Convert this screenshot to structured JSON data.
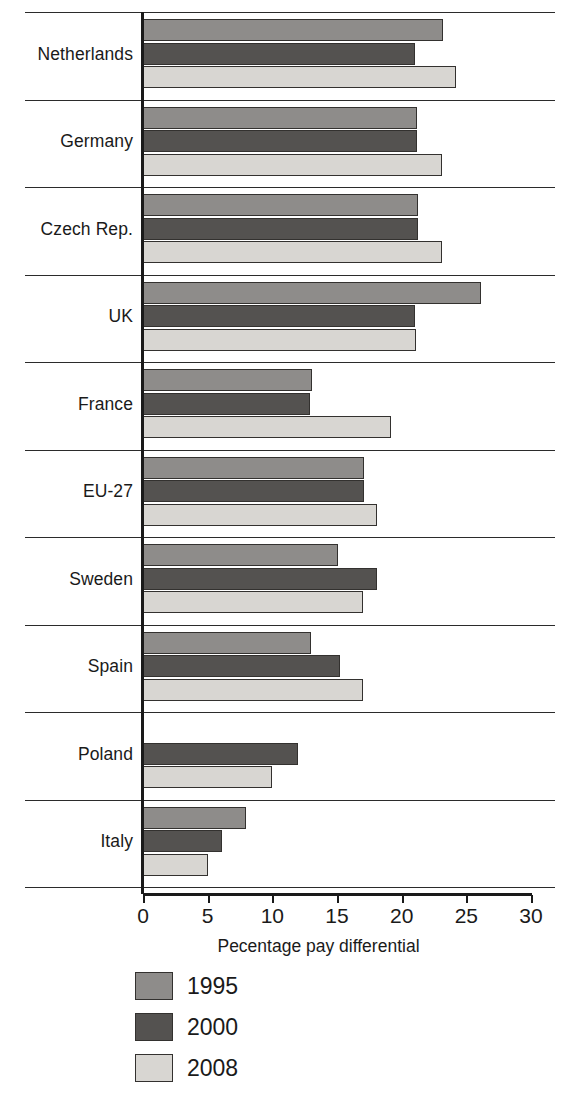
{
  "chart_data": {
    "type": "bar",
    "orientation": "horizontal",
    "title": "",
    "xlabel": "Pecentage pay differential",
    "ylabel": "",
    "xlim": [
      0,
      30
    ],
    "xticks": [
      0,
      5,
      10,
      15,
      20,
      25,
      30
    ],
    "xtick_labels": [
      "0",
      "5",
      "10",
      "15",
      "20",
      "25",
      "30"
    ],
    "grid": false,
    "legend_position": "bottom",
    "categories": [
      "Netherlands",
      "Germany",
      "Czech Rep.",
      "UK",
      "France",
      "EU-27",
      "Sweden",
      "Spain",
      "Poland",
      "Italy"
    ],
    "series": [
      {
        "name": "1995",
        "color": "#8e8c8a",
        "values": [
          23.2,
          21.2,
          21.3,
          26.1,
          13.1,
          17.1,
          15.1,
          13.0,
          0,
          8.0
        ]
      },
      {
        "name": "2000",
        "color": "#545250",
        "values": [
          21.0,
          21.2,
          21.3,
          21.0,
          12.9,
          17.1,
          18.1,
          15.2,
          12.0,
          6.1
        ]
      },
      {
        "name": "2008",
        "color": "#d8d6d2",
        "values": [
          24.2,
          23.1,
          23.1,
          21.1,
          19.2,
          18.1,
          17.0,
          17.0,
          10.0,
          5.0
        ]
      }
    ]
  },
  "legend": {
    "entries": [
      {
        "label": "1995",
        "swatch": "legend-swatch-1995"
      },
      {
        "label": "2000",
        "swatch": "legend-swatch-2000"
      },
      {
        "label": "2008",
        "swatch": "legend-swatch-2008"
      }
    ]
  }
}
